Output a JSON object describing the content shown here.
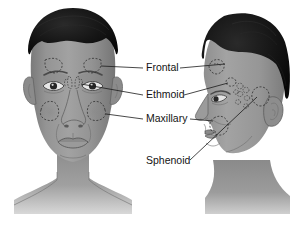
{
  "illustration": {
    "title": "Paranasal sinuses anatomical diagram",
    "views": [
      {
        "name": "anterior-view",
        "description": "Front view of head showing sinus locations"
      },
      {
        "name": "lateral-view",
        "description": "Side profile view of head showing sinus locations"
      }
    ],
    "background_color": "#ffffff",
    "skin_color": "#8e8e8e",
    "hair_color": "#111111",
    "label_color": "#141414",
    "leader_line_color": "#1a1a1a"
  },
  "labels": [
    {
      "id": "frontal",
      "text": "Frontal",
      "x": 146,
      "y": 68,
      "has_left_leader": true,
      "has_right_leader": true
    },
    {
      "id": "ethmoid",
      "text": "Ethmoid",
      "x": 146,
      "y": 95,
      "has_left_leader": true,
      "has_right_leader": true
    },
    {
      "id": "maxillary",
      "text": "Maxillary",
      "x": 146,
      "y": 119,
      "has_left_leader": true,
      "has_right_leader": true
    },
    {
      "id": "sphenoid",
      "text": "Sphenoid",
      "x": 146,
      "y": 161,
      "has_left_leader": false,
      "has_right_leader": true
    }
  ],
  "sinus_regions": {
    "frontal": {
      "label": "Frontal sinus",
      "anterior_count": 2,
      "lateral_count": 1,
      "shape": "triangular-dashed"
    },
    "ethmoid": {
      "label": "Ethmoid sinus",
      "shape": "small-air-cells",
      "anterior_count": 2,
      "lateral_count": 8
    },
    "maxillary": {
      "label": "Maxillary sinus",
      "anterior_count": 2,
      "lateral_count": 1,
      "shape": "rounded-dashed"
    },
    "sphenoid": {
      "label": "Sphenoid sinus",
      "anterior_count": 0,
      "lateral_count": 1,
      "shape": "rounded-dashed"
    }
  }
}
